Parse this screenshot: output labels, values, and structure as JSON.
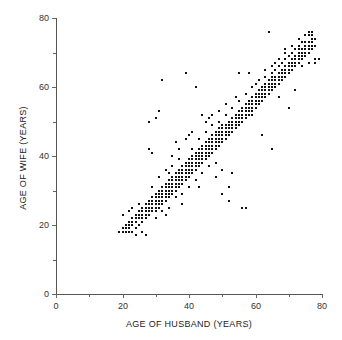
{
  "chart_data": {
    "type": "scatter",
    "title": "",
    "xlabel": "AGE OF HUSBAND (YEARS)",
    "ylabel": "AGE OF WIFE (YEARS)",
    "xlim": [
      0,
      80
    ],
    "ylim": [
      0,
      80
    ],
    "xticks": [
      0,
      20,
      40,
      60,
      80
    ],
    "yticks": [
      0,
      20,
      40,
      60,
      80
    ],
    "xtick_labels": [
      "0",
      "20",
      "40",
      "60",
      "80"
    ],
    "ytick_labels": [
      "0",
      "20",
      "40",
      "60",
      "80"
    ],
    "xminor_ticks": [
      10,
      30,
      50,
      70
    ],
    "yminor_ticks": [
      10,
      30,
      50,
      70
    ],
    "grid": false,
    "legend": null,
    "marker": "square",
    "marker_color": "#111111",
    "marker_size_px": 2,
    "series_name": "couples",
    "n_points": 335,
    "points": [
      [
        19,
        18
      ],
      [
        20,
        18
      ],
      [
        20,
        19
      ],
      [
        21,
        18
      ],
      [
        21,
        19
      ],
      [
        21,
        20
      ],
      [
        22,
        18
      ],
      [
        22,
        19
      ],
      [
        22,
        20
      ],
      [
        22,
        21
      ],
      [
        23,
        18
      ],
      [
        23,
        20
      ],
      [
        23,
        21
      ],
      [
        23,
        22
      ],
      [
        24,
        19
      ],
      [
        24,
        21
      ],
      [
        24,
        22
      ],
      [
        24,
        23
      ],
      [
        25,
        20
      ],
      [
        25,
        22
      ],
      [
        25,
        23
      ],
      [
        25,
        24
      ],
      [
        26,
        21
      ],
      [
        26,
        22
      ],
      [
        26,
        23
      ],
      [
        26,
        24
      ],
      [
        26,
        25
      ],
      [
        27,
        22
      ],
      [
        27,
        23
      ],
      [
        27,
        24
      ],
      [
        27,
        25
      ],
      [
        27,
        26
      ],
      [
        28,
        23
      ],
      [
        28,
        24
      ],
      [
        28,
        25
      ],
      [
        28,
        26
      ],
      [
        28,
        27
      ],
      [
        29,
        24
      ],
      [
        29,
        25
      ],
      [
        29,
        26
      ],
      [
        29,
        27
      ],
      [
        29,
        28
      ],
      [
        30,
        24
      ],
      [
        30,
        25
      ],
      [
        30,
        26
      ],
      [
        30,
        27
      ],
      [
        30,
        28
      ],
      [
        30,
        29
      ],
      [
        31,
        25
      ],
      [
        31,
        26
      ],
      [
        31,
        27
      ],
      [
        31,
        28
      ],
      [
        31,
        29
      ],
      [
        31,
        30
      ],
      [
        32,
        26
      ],
      [
        32,
        27
      ],
      [
        32,
        28
      ],
      [
        32,
        29
      ],
      [
        32,
        30
      ],
      [
        32,
        31
      ],
      [
        33,
        27
      ],
      [
        33,
        28
      ],
      [
        33,
        29
      ],
      [
        33,
        30
      ],
      [
        33,
        31
      ],
      [
        33,
        32
      ],
      [
        34,
        28
      ],
      [
        34,
        29
      ],
      [
        34,
        30
      ],
      [
        34,
        31
      ],
      [
        34,
        32
      ],
      [
        34,
        33
      ],
      [
        35,
        29
      ],
      [
        35,
        30
      ],
      [
        35,
        31
      ],
      [
        35,
        32
      ],
      [
        35,
        33
      ],
      [
        35,
        34
      ],
      [
        36,
        30
      ],
      [
        36,
        31
      ],
      [
        36,
        32
      ],
      [
        36,
        33
      ],
      [
        36,
        34
      ],
      [
        36,
        35
      ],
      [
        37,
        31
      ],
      [
        37,
        32
      ],
      [
        37,
        33
      ],
      [
        37,
        34
      ],
      [
        37,
        35
      ],
      [
        37,
        36
      ],
      [
        38,
        32
      ],
      [
        38,
        33
      ],
      [
        38,
        34
      ],
      [
        38,
        35
      ],
      [
        38,
        36
      ],
      [
        38,
        37
      ],
      [
        39,
        33
      ],
      [
        39,
        34
      ],
      [
        39,
        35
      ],
      [
        39,
        36
      ],
      [
        39,
        37
      ],
      [
        39,
        38
      ],
      [
        40,
        34
      ],
      [
        40,
        35
      ],
      [
        40,
        36
      ],
      [
        40,
        37
      ],
      [
        40,
        38
      ],
      [
        40,
        39
      ],
      [
        41,
        35
      ],
      [
        41,
        36
      ],
      [
        41,
        37
      ],
      [
        41,
        38
      ],
      [
        41,
        39
      ],
      [
        41,
        40
      ],
      [
        42,
        36
      ],
      [
        42,
        37
      ],
      [
        42,
        38
      ],
      [
        42,
        39
      ],
      [
        42,
        40
      ],
      [
        42,
        41
      ],
      [
        43,
        37
      ],
      [
        43,
        38
      ],
      [
        43,
        39
      ],
      [
        43,
        40
      ],
      [
        43,
        41
      ],
      [
        43,
        42
      ],
      [
        44,
        38
      ],
      [
        44,
        39
      ],
      [
        44,
        40
      ],
      [
        44,
        41
      ],
      [
        44,
        42
      ],
      [
        44,
        43
      ],
      [
        45,
        39
      ],
      [
        45,
        40
      ],
      [
        45,
        41
      ],
      [
        45,
        42
      ],
      [
        45,
        43
      ],
      [
        45,
        44
      ],
      [
        46,
        40
      ],
      [
        46,
        41
      ],
      [
        46,
        42
      ],
      [
        46,
        43
      ],
      [
        46,
        44
      ],
      [
        46,
        45
      ],
      [
        47,
        41
      ],
      [
        47,
        42
      ],
      [
        47,
        43
      ],
      [
        47,
        44
      ],
      [
        47,
        45
      ],
      [
        47,
        46
      ],
      [
        48,
        42
      ],
      [
        48,
        43
      ],
      [
        48,
        44
      ],
      [
        48,
        45
      ],
      [
        48,
        46
      ],
      [
        48,
        47
      ],
      [
        49,
        43
      ],
      [
        49,
        44
      ],
      [
        49,
        45
      ],
      [
        49,
        46
      ],
      [
        49,
        47
      ],
      [
        49,
        48
      ],
      [
        50,
        44
      ],
      [
        50,
        45
      ],
      [
        50,
        46
      ],
      [
        50,
        47
      ],
      [
        50,
        48
      ],
      [
        50,
        49
      ],
      [
        51,
        45
      ],
      [
        51,
        46
      ],
      [
        51,
        47
      ],
      [
        51,
        48
      ],
      [
        51,
        49
      ],
      [
        52,
        46
      ],
      [
        52,
        47
      ],
      [
        52,
        48
      ],
      [
        52,
        49
      ],
      [
        52,
        50
      ],
      [
        53,
        47
      ],
      [
        53,
        48
      ],
      [
        53,
        49
      ],
      [
        53,
        50
      ],
      [
        53,
        51
      ],
      [
        54,
        48
      ],
      [
        54,
        49
      ],
      [
        54,
        50
      ],
      [
        54,
        51
      ],
      [
        54,
        52
      ],
      [
        55,
        49
      ],
      [
        55,
        50
      ],
      [
        55,
        51
      ],
      [
        55,
        52
      ],
      [
        55,
        53
      ],
      [
        56,
        50
      ],
      [
        56,
        51
      ],
      [
        56,
        52
      ],
      [
        56,
        53
      ],
      [
        56,
        54
      ],
      [
        57,
        51
      ],
      [
        57,
        52
      ],
      [
        57,
        53
      ],
      [
        57,
        54
      ],
      [
        57,
        55
      ],
      [
        58,
        52
      ],
      [
        58,
        53
      ],
      [
        58,
        54
      ],
      [
        58,
        55
      ],
      [
        58,
        56
      ],
      [
        59,
        53
      ],
      [
        59,
        54
      ],
      [
        59,
        55
      ],
      [
        59,
        56
      ],
      [
        59,
        57
      ],
      [
        60,
        54
      ],
      [
        60,
        55
      ],
      [
        60,
        56
      ],
      [
        60,
        57
      ],
      [
        60,
        58
      ],
      [
        61,
        55
      ],
      [
        61,
        56
      ],
      [
        61,
        57
      ],
      [
        61,
        58
      ],
      [
        61,
        59
      ],
      [
        62,
        56
      ],
      [
        62,
        57
      ],
      [
        62,
        58
      ],
      [
        62,
        59
      ],
      [
        62,
        60
      ],
      [
        63,
        57
      ],
      [
        63,
        58
      ],
      [
        63,
        59
      ],
      [
        63,
        60
      ],
      [
        63,
        61
      ],
      [
        64,
        58
      ],
      [
        64,
        59
      ],
      [
        64,
        60
      ],
      [
        64,
        61
      ],
      [
        64,
        62
      ],
      [
        65,
        59
      ],
      [
        65,
        60
      ],
      [
        65,
        61
      ],
      [
        65,
        62
      ],
      [
        65,
        63
      ],
      [
        66,
        60
      ],
      [
        66,
        61
      ],
      [
        66,
        62
      ],
      [
        66,
        63
      ],
      [
        67,
        61
      ],
      [
        67,
        62
      ],
      [
        67,
        63
      ],
      [
        67,
        64
      ],
      [
        68,
        62
      ],
      [
        68,
        63
      ],
      [
        68,
        64
      ],
      [
        68,
        65
      ],
      [
        69,
        63
      ],
      [
        69,
        64
      ],
      [
        69,
        65
      ],
      [
        69,
        66
      ],
      [
        70,
        64
      ],
      [
        70,
        65
      ],
      [
        70,
        66
      ],
      [
        70,
        67
      ],
      [
        71,
        65
      ],
      [
        71,
        66
      ],
      [
        71,
        67
      ],
      [
        71,
        68
      ],
      [
        72,
        66
      ],
      [
        72,
        67
      ],
      [
        72,
        68
      ],
      [
        72,
        69
      ],
      [
        73,
        67
      ],
      [
        73,
        68
      ],
      [
        73,
        69
      ],
      [
        73,
        70
      ],
      [
        74,
        68
      ],
      [
        74,
        69
      ],
      [
        74,
        70
      ],
      [
        74,
        71
      ],
      [
        75,
        69
      ],
      [
        75,
        70
      ],
      [
        75,
        71
      ],
      [
        75,
        72
      ],
      [
        76,
        70
      ],
      [
        76,
        71
      ],
      [
        76,
        72
      ],
      [
        76,
        73
      ],
      [
        77,
        71
      ],
      [
        77,
        72
      ],
      [
        77,
        73
      ],
      [
        77,
        74
      ],
      [
        77,
        75
      ],
      [
        77,
        76
      ],
      [
        78,
        68
      ],
      [
        78,
        72
      ],
      [
        78,
        74
      ],
      [
        79,
        68
      ],
      [
        76,
        75
      ],
      [
        76,
        76
      ],
      [
        75,
        73
      ],
      [
        74,
        73
      ],
      [
        73,
        72
      ],
      [
        72,
        71
      ],
      [
        71,
        70
      ],
      [
        70,
        69
      ],
      [
        69,
        68
      ],
      [
        68,
        67
      ],
      [
        67,
        66
      ],
      [
        66,
        65
      ],
      [
        65,
        64
      ],
      [
        30,
        51
      ],
      [
        31,
        53
      ],
      [
        32,
        62
      ],
      [
        28,
        50
      ],
      [
        28,
        42
      ],
      [
        39,
        64
      ],
      [
        42,
        60
      ],
      [
        40,
        46
      ],
      [
        64,
        76
      ],
      [
        33,
        23
      ],
      [
        23,
        25
      ],
      [
        29,
        41
      ],
      [
        36,
        44
      ],
      [
        35,
        40
      ],
      [
        44,
        52
      ],
      [
        47,
        52
      ],
      [
        46,
        51
      ],
      [
        45,
        50
      ],
      [
        55,
        64
      ],
      [
        58,
        64
      ],
      [
        59,
        52
      ],
      [
        62,
        46
      ],
      [
        65,
        42
      ],
      [
        67,
        57
      ],
      [
        70,
        54
      ],
      [
        72,
        59
      ],
      [
        52,
        27
      ],
      [
        56,
        25
      ],
      [
        57,
        25
      ],
      [
        53,
        35
      ],
      [
        50,
        36
      ],
      [
        48,
        38
      ],
      [
        43,
        31
      ],
      [
        38,
        29
      ],
      [
        34,
        35
      ],
      [
        37,
        39
      ],
      [
        41,
        47
      ],
      [
        49,
        53
      ],
      [
        51,
        55
      ],
      [
        54,
        57
      ],
      [
        60,
        61
      ],
      [
        63,
        65
      ],
      [
        66,
        67
      ],
      [
        69,
        71
      ],
      [
        73,
        74
      ],
      [
        24,
        17
      ],
      [
        26,
        18
      ],
      [
        27,
        17
      ],
      [
        20,
        23
      ],
      [
        22,
        24
      ],
      [
        25,
        26
      ],
      [
        29,
        31
      ],
      [
        31,
        34
      ],
      [
        33,
        36
      ],
      [
        35,
        37
      ],
      [
        37,
        42
      ],
      [
        39,
        45
      ],
      [
        41,
        42
      ],
      [
        43,
        45
      ],
      [
        45,
        47
      ],
      [
        47,
        49
      ],
      [
        49,
        50
      ],
      [
        51,
        52
      ],
      [
        53,
        54
      ],
      [
        55,
        56
      ],
      [
        57,
        58
      ],
      [
        59,
        60
      ],
      [
        61,
        62
      ],
      [
        63,
        63
      ],
      [
        65,
        66
      ],
      [
        67,
        68
      ],
      [
        69,
        70
      ],
      [
        71,
        72
      ],
      [
        73,
        71
      ],
      [
        75,
        75
      ],
      [
        78,
        67
      ],
      [
        76,
        67
      ],
      [
        74,
        66
      ],
      [
        44,
        35
      ],
      [
        46,
        37
      ],
      [
        48,
        34
      ],
      [
        50,
        29
      ],
      [
        52,
        31
      ],
      [
        42,
        33
      ],
      [
        40,
        31
      ],
      [
        38,
        26
      ],
      [
        36,
        28
      ],
      [
        34,
        25
      ],
      [
        32,
        24
      ],
      [
        30,
        22
      ]
    ]
  }
}
